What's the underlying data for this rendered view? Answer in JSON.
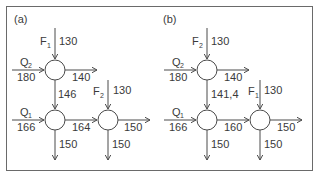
{
  "diagram": {
    "panels": [
      {
        "label": "(a)",
        "top_input": {
          "name": "F",
          "sub": "1",
          "value": "130"
        },
        "left_input_top": {
          "name": "Q",
          "sub": "2",
          "value": "180"
        },
        "top_right_out": "140",
        "top_down": "146",
        "left_input_bottom": {
          "name": "Q",
          "sub": "1",
          "value": "166"
        },
        "middle_link": "164",
        "right_input": {
          "name": "F",
          "sub": "2",
          "value": "130"
        },
        "right_out": "150",
        "left_down_out": "150",
        "right_down_out": "150"
      },
      {
        "label": "(b)",
        "top_input": {
          "name": "F",
          "sub": "2",
          "value": "130"
        },
        "left_input_top": {
          "name": "Q",
          "sub": "2",
          "value": "180"
        },
        "top_right_out": "140",
        "top_down": "141,4",
        "left_input_bottom": {
          "name": "Q",
          "sub": "1",
          "value": "166"
        },
        "middle_link": "160",
        "right_input": {
          "name": "F",
          "sub": "1",
          "value": "130"
        },
        "right_out": "150",
        "left_down_out": "150",
        "right_down_out": "150"
      }
    ]
  }
}
